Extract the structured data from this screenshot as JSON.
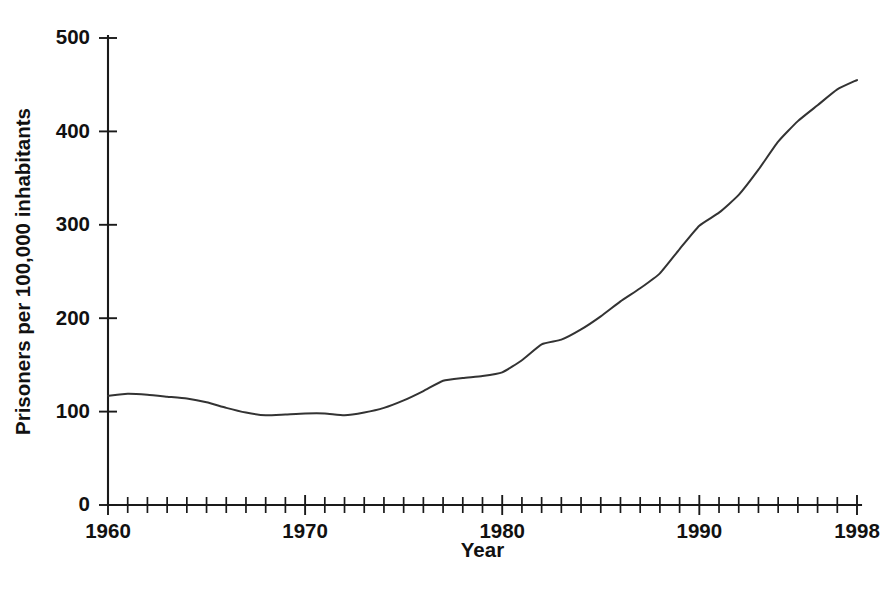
{
  "chart_data": {
    "type": "line",
    "title": "",
    "subtitle": "",
    "xlabel": "Year",
    "ylabel": "Prisoners per 100,000 inhabitants",
    "xlim": [
      1960,
      1998
    ],
    "ylim": [
      0,
      500
    ],
    "xticks_major": [
      1960,
      1970,
      1980,
      1990,
      1998
    ],
    "xtick_labels": [
      "1960",
      "1970",
      "1980",
      "1990",
      "1998"
    ],
    "xticks_minor_step": 1,
    "yticks": [
      0,
      100,
      200,
      300,
      400,
      500
    ],
    "ytick_labels": [
      "0",
      "100",
      "200",
      "300",
      "400",
      "500"
    ],
    "grid": false,
    "legend": null,
    "legend_position": "none",
    "line_color": "#333333",
    "axis_color": "#1a1a1a",
    "background_color": "#ffffff",
    "annotations": [],
    "x": [
      1960,
      1961,
      1962,
      1963,
      1964,
      1965,
      1966,
      1967,
      1968,
      1969,
      1970,
      1971,
      1972,
      1973,
      1974,
      1975,
      1976,
      1977,
      1978,
      1979,
      1980,
      1981,
      1982,
      1983,
      1984,
      1985,
      1986,
      1987,
      1988,
      1989,
      1990,
      1991,
      1992,
      1993,
      1994,
      1995,
      1996,
      1997,
      1998
    ],
    "values": [
      117,
      119,
      118,
      116,
      114,
      110,
      104,
      99,
      96,
      97,
      98,
      98,
      96,
      99,
      104,
      112,
      122,
      133,
      136,
      138,
      142,
      155,
      172,
      177,
      188,
      202,
      218,
      232,
      248,
      274,
      299,
      313,
      332,
      359,
      389,
      411,
      428,
      445,
      455
    ],
    "series": [
      {
        "name": "Prisoners per 100,000 inhabitants",
        "values": [
          117,
          119,
          118,
          116,
          114,
          110,
          104,
          99,
          96,
          97,
          98,
          98,
          96,
          99,
          104,
          112,
          122,
          133,
          136,
          138,
          142,
          155,
          172,
          177,
          188,
          202,
          218,
          232,
          248,
          274,
          299,
          313,
          332,
          359,
          389,
          411,
          428,
          445,
          455
        ]
      }
    ]
  }
}
